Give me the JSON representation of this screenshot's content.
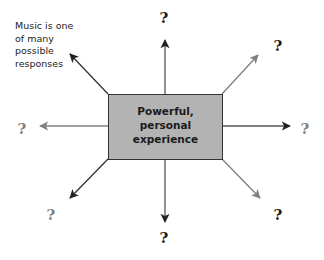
{
  "diagram": {
    "center": {
      "label": "Powerful,\npersonal\nexperience",
      "fill": "#b3b3b3",
      "border": "#333333"
    },
    "note": {
      "text": "Music is one\nof many\npossible\nresponses"
    },
    "outcomes": [
      {
        "id": "top",
        "label": "?",
        "tone": "dark"
      },
      {
        "id": "top-right",
        "label": "?",
        "tone": "dark"
      },
      {
        "id": "right",
        "label": "?",
        "tone": "light"
      },
      {
        "id": "bottom-right",
        "label": "?",
        "tone": "dark"
      },
      {
        "id": "bottom",
        "label": "?",
        "tone": "dark"
      },
      {
        "id": "bottom-left",
        "label": "?",
        "tone": "light"
      },
      {
        "id": "left",
        "label": "?",
        "tone": "light"
      },
      {
        "id": "top-left",
        "label": "Music is one of many possible responses",
        "tone": "dark"
      }
    ],
    "colors": {
      "dark_arrow": "#222222",
      "light_arrow": "#808080",
      "dark_text": "#1a1a1a",
      "light_text": "#808080"
    }
  }
}
